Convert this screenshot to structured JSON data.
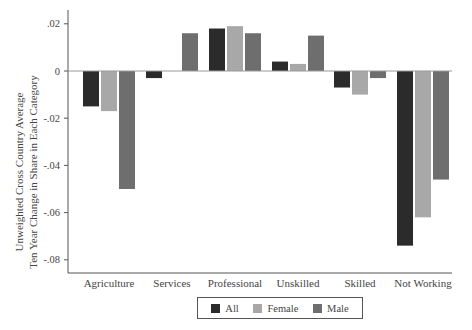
{
  "chart_data": {
    "type": "bar",
    "title": "",
    "xlabel": "",
    "ylabel": "Unweighted Cross Country Average Ten Year Change in Share in Each Category",
    "ylabel_lines": [
      "Unweighted Cross Country Average",
      "Ten Year Change in Share in Each Category"
    ],
    "categories": [
      "Agriculture",
      "Services",
      "Professional",
      "Unskilled",
      "Skilled",
      "Not Working"
    ],
    "series": [
      {
        "name": "All",
        "color": "#2b2b2b",
        "values": [
          -0.015,
          -0.003,
          0.018,
          0.004,
          -0.007,
          -0.074
        ]
      },
      {
        "name": "Female",
        "color": "#a8a8a8",
        "values": [
          -0.017,
          0.0,
          0.019,
          0.003,
          -0.01,
          -0.062
        ]
      },
      {
        "name": "Male",
        "color": "#6e6e6e",
        "values": [
          -0.05,
          0.016,
          0.016,
          0.015,
          -0.003,
          -0.046
        ]
      }
    ],
    "yticks": [
      0.02,
      0,
      -0.02,
      -0.04,
      -0.06,
      -0.08
    ],
    "ytick_labels": [
      ".02",
      "0",
      "-.02",
      "-.04",
      "-.06",
      "-.08"
    ],
    "ylim": [
      -0.085,
      0.026
    ],
    "grid": false,
    "zero_line": true,
    "legend_position": "bottom"
  },
  "legend": {
    "items": [
      {
        "label": "All",
        "color": "#2b2b2b"
      },
      {
        "label": "Female",
        "color": "#a8a8a8"
      },
      {
        "label": "Male",
        "color": "#6e6e6e"
      }
    ]
  }
}
